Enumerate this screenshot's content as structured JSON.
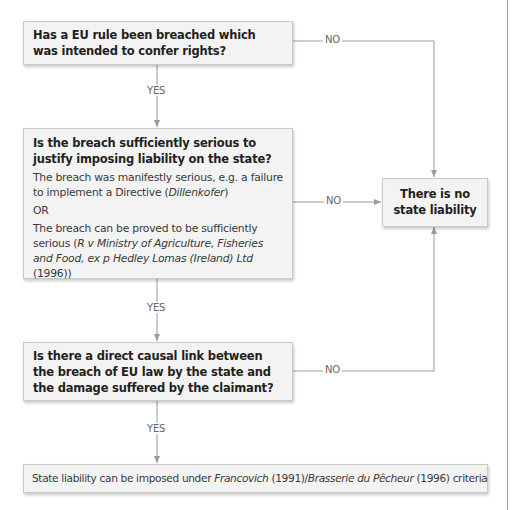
{
  "flowchart": {
    "q1": {
      "text": "Has a EU rule been breached which was intended to confer rights?"
    },
    "q2": {
      "title": "Is the breach sufficiently serious to justify imposing liability on the state?",
      "option1_text": "The breach was manifestly serious, e.g. a failure to implement a Directive (",
      "option1_case": "Dillenkofer",
      "option1_end": ")",
      "or": "OR",
      "option2_text": "The breach can be proved to be sufficiently serious (",
      "option2_case": "R v Ministry of Agriculture, Fisheries and Food, ex p Hedley Lomas (Ireland) Ltd",
      "option2_end": " (1996))"
    },
    "q3": {
      "text": "Is there a direct causal link between the breach of EU law by the state and the damage suffered by the claimant?"
    },
    "outcome_no": {
      "text": "There is no state liability"
    },
    "outcome_yes": {
      "prefix": "State liability can be imposed under ",
      "case1": "Francovich",
      "mid": " (1991)/",
      "case2": "Brasserie du Pêcheur",
      "suffix": " (1996) criteria"
    },
    "labels": {
      "yes": "YES",
      "no": "NO"
    },
    "colors": {
      "box_fill": "#f3f3f3",
      "box_border": "#c9c9c9",
      "line": "#9a9a9a"
    }
  }
}
